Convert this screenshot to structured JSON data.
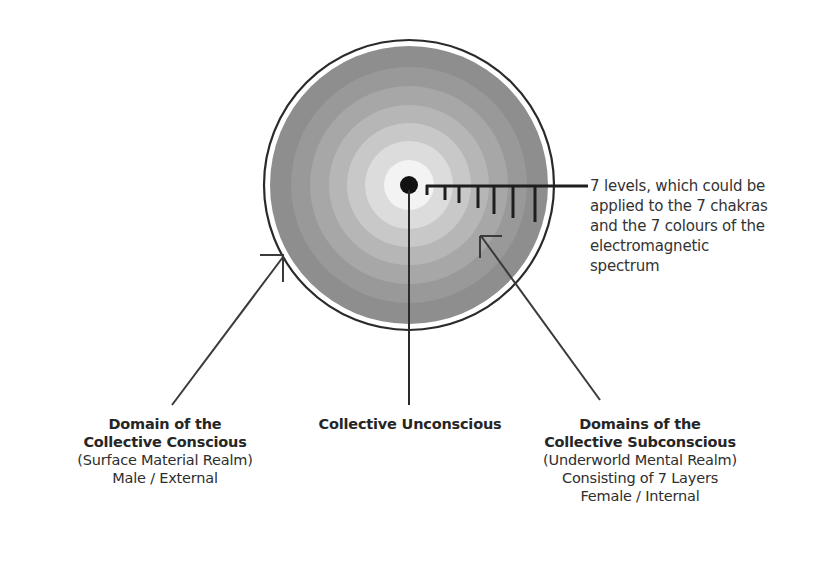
{
  "diagram": {
    "levels_note": {
      "line1": "7 levels, which could be",
      "line2": "applied to the 7 chakras",
      "line3": "and the 7 colours of the",
      "line4": "electromagnetic",
      "line5": "spectrum"
    },
    "collective_conscious": {
      "title_line1": "Domain of the",
      "title_line2": "Collective Conscious",
      "subtitle": "(Surface Material Realm)",
      "detail": "Male / External"
    },
    "collective_unconscious": {
      "title": "Collective Unconscious"
    },
    "collective_subconscious": {
      "title_line1": "Domains of the",
      "title_line2": "Collective Subconscious",
      "subtitle": "(Underworld Mental Realm)",
      "detail1": "Consisting of 7 Layers",
      "detail2": "Female / Internal"
    },
    "rings": {
      "count": 7,
      "colors": [
        "#8e8e8e",
        "#999999",
        "#a8a8a8",
        "#b7b7b7",
        "#c8c8c8",
        "#dadada",
        "#f2f2f2"
      ]
    },
    "colors": {
      "outline": "#2a2a2a",
      "center_dot": "#111111"
    }
  }
}
